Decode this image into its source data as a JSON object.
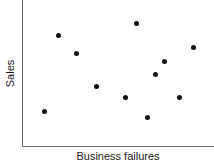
{
  "chart_data": {
    "type": "scatter",
    "title": "",
    "subtitle": "",
    "xlabel": "Business failures",
    "ylabel": "Sales",
    "grid": false,
    "legend": null,
    "x_tick_labels": [],
    "y_tick_labels": [],
    "xlim": [
      0,
      100
    ],
    "ylim": [
      0,
      100
    ],
    "marker": {
      "shape": "circle",
      "filled": true,
      "color": "#111111",
      "size_px": 5
    },
    "axis_color": "#6e6e6e",
    "point_count": 11,
    "points": [
      {
        "x": 18.8,
        "y": 76.2,
        "px": 58,
        "py": 35
      },
      {
        "x": 28.1,
        "y": 64.0,
        "px": 76,
        "py": 53
      },
      {
        "x": 59.4,
        "y": 84.4,
        "px": 136,
        "py": 23
      },
      {
        "x": 89.1,
        "y": 68.0,
        "px": 193,
        "py": 47
      },
      {
        "x": 69.3,
        "y": 49.7,
        "px": 155,
        "py": 74
      },
      {
        "x": 38.5,
        "y": 41.5,
        "px": 96,
        "py": 86
      },
      {
        "x": 53.6,
        "y": 34.0,
        "px": 125,
        "py": 97
      },
      {
        "x": 81.8,
        "y": 34.0,
        "px": 179,
        "py": 97
      },
      {
        "x": 65.1,
        "y": 20.4,
        "px": 147,
        "py": 117
      },
      {
        "x": 11.5,
        "y": 24.5,
        "px": 44,
        "py": 111
      },
      {
        "x": 73.4,
        "y": 58.5,
        "px": 164,
        "py": 61
      }
    ]
  }
}
